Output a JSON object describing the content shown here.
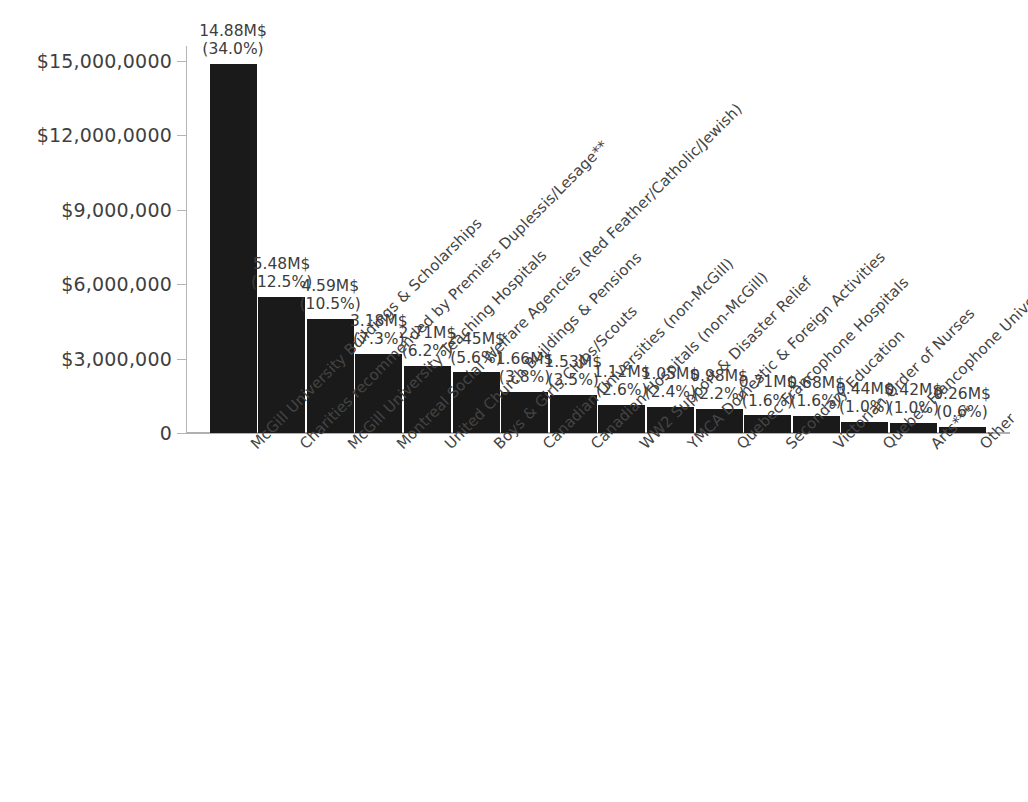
{
  "chart_data": {
    "type": "bar",
    "title": "",
    "subtitle": "",
    "xlabel": "",
    "ylabel": "",
    "ylim": [
      0,
      15600000
    ],
    "grid": false,
    "legend": null,
    "orientation": "vertical",
    "bar_color": "#1a1a1a",
    "axis_color": "#b4b4b4",
    "text_color": "#3d3d3d",
    "y_ticks": [
      {
        "value": 15000000,
        "label": "$15,000,0000"
      },
      {
        "value": 12000000,
        "label": "$12,000,0000"
      },
      {
        "value": 9000000,
        "label": "$9,000,000"
      },
      {
        "value": 6000000,
        "label": "$6,000,000"
      },
      {
        "value": 3000000,
        "label": "$3,000,000"
      },
      {
        "value": 0,
        "label": "0"
      }
    ],
    "categories": [
      "McGill University Buildings & Scholarships",
      "Charities recommended by Premiers Duplessis/Lesage**",
      "McGill University Teaching Hospitals",
      "Montreal Social Welfare Agencies (Red Feather/Catholic/Jewish)",
      "United Church Buildings & Pensions",
      "Boys & Girls Clubs/Scouts",
      "Canadian Universities (non-McGill)",
      "Canadian Hospitals (non-McGill)",
      "WW2 Support & Disaster Relief",
      "YMCA Domestic & Foreign Activities",
      "Quebec Francophone Hospitals",
      "Secondary Education",
      "Victorian Order of Nurses",
      "Quebec Francophone Universities",
      "Arts***",
      "Other"
    ],
    "values": [
      14880000,
      5480000,
      4590000,
      3180000,
      2710000,
      2450000,
      1660000,
      1530000,
      1120000,
      1050000,
      980000,
      710000,
      680000,
      440000,
      420000,
      260000
    ],
    "percentages": [
      34.0,
      12.5,
      10.5,
      7.3,
      6.2,
      5.6,
      3.8,
      3.5,
      2.6,
      2.4,
      2.2,
      1.6,
      1.6,
      1.0,
      1.0,
      0.6
    ],
    "point_labels": [
      {
        "amount": "14.88M$",
        "percent": "(34.0%)"
      },
      {
        "amount": "5.48M$",
        "percent": "(12.5%)"
      },
      {
        "amount": "4.59M$",
        "percent": "(10.5%)"
      },
      {
        "amount": "3.18M$",
        "percent": "(7.3%)"
      },
      {
        "amount": "2.71M$",
        "percent": "(6.2%)"
      },
      {
        "amount": "2.45M$",
        "percent": "(5.6%)"
      },
      {
        "amount": "1.66M$",
        "percent": "(3.8%)"
      },
      {
        "amount": "1.53M$",
        "percent": "(3.5%)"
      },
      {
        "amount": "1.12M$",
        "percent": "(2.6%)"
      },
      {
        "amount": "1.05M$",
        "percent": "(2.4%)"
      },
      {
        "amount": "0.98M$",
        "percent": "(2.2%)"
      },
      {
        "amount": "0.71M$",
        "percent": "(1.6%)"
      },
      {
        "amount": "0.68M$",
        "percent": "(1.6%)"
      },
      {
        "amount": "0.44M$",
        "percent": "(1.0%)"
      },
      {
        "amount": "0.42M$",
        "percent": "(1.0%)"
      },
      {
        "amount": "0.26M$",
        "percent": "(0.6%)"
      }
    ]
  }
}
